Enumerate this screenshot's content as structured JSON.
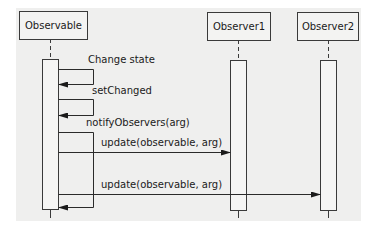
{
  "diagram": {
    "type": "uml-sequence",
    "participants": [
      {
        "id": "observable",
        "label": "Observable"
      },
      {
        "id": "observer1",
        "label": "Observer1"
      },
      {
        "id": "observer2",
        "label": "Observer2"
      }
    ],
    "messages": [
      {
        "from": "observable",
        "to": "observable",
        "label": "Change state"
      },
      {
        "from": "observable",
        "to": "observable",
        "label": "setChanged"
      },
      {
        "from": "observable",
        "to": "observable",
        "label": "notifyObservers(arg)"
      },
      {
        "from": "observable",
        "to": "observer1",
        "label": "update(observable, arg)"
      },
      {
        "from": "observable",
        "to": "observer2",
        "label": "update(observable, arg)"
      }
    ]
  }
}
